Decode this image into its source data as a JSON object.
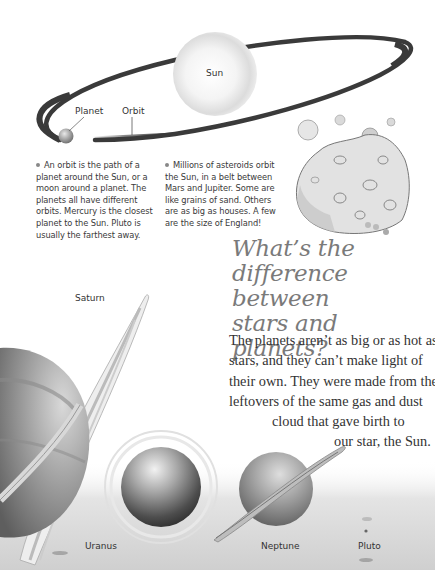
{
  "diagram": {
    "sun_label": "Sun",
    "planet_label": "Planet",
    "orbit_label": "Orbit"
  },
  "facts": {
    "orbit": {
      "bullet_icon": "bullet-dot",
      "lines": [
        "An orbit is the path of a",
        "planet around the Sun, or a",
        "moon around a planet. The",
        "planets all have different",
        "orbits. Mercury is the closest",
        "planet to the Sun. Pluto is",
        "usually the farthest away."
      ]
    },
    "asteroids": {
      "bullet_icon": "bullet-dot",
      "lines": [
        "Millions of asteroids orbit",
        "the Sun, in a belt between",
        "Mars and Jupiter. Some are",
        "like grains of sand. Others",
        "are as big as houses. A few",
        "are the size of England!"
      ]
    }
  },
  "heading": {
    "lines": [
      "What’s the",
      "difference between",
      "stars and planets?"
    ]
  },
  "body": {
    "lines": [
      "The planets aren’t as big or as hot as",
      "stars, and they can’t make light of",
      "their own. They were made from the",
      "leftovers of the same gas and dust",
      "cloud that gave birth to",
      "our star, the Sun."
    ]
  },
  "planet_labels": {
    "saturn": "Saturn",
    "uranus": "Uranus",
    "neptune": "Neptune",
    "pluto": "Pluto"
  },
  "colors": {
    "orbit": "#3a3a3a",
    "heading": "#7a7a7a",
    "text": "#333333",
    "background": "#ffffff"
  }
}
